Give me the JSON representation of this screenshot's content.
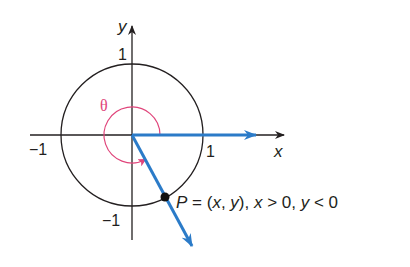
{
  "diagram": {
    "axes": {
      "x_label": "x",
      "y_label": "y",
      "x_ticks": [
        {
          "label": "−1",
          "value": -1
        },
        {
          "label": "1",
          "value": 1
        }
      ],
      "y_ticks": [
        {
          "label": "1",
          "value": 1
        },
        {
          "label": "−1",
          "value": -1
        }
      ]
    },
    "circle": {
      "type": "unit circle",
      "radius": 1
    },
    "angle": {
      "label": "θ",
      "color": "#e0457b",
      "direction": "counterclockwise",
      "approx_degrees": 300
    },
    "initial_side": {
      "color": "#2b7bc8",
      "along": "positive x-axis"
    },
    "terminal_side": {
      "color": "#2b7bc8",
      "quadrant": "IV"
    },
    "point": {
      "name": "P",
      "label_parts": {
        "p": "P",
        "eq": " = (",
        "x": "x",
        "comma": ", ",
        "y": "y",
        "close": "), ",
        "x2": "x",
        "gt": " > 0, ",
        "y2": "y",
        "lt": " < 0"
      }
    },
    "colors": {
      "axis": "#231f20",
      "circle": "#231f20",
      "ray": "#2b7bc8",
      "arc": "#e0457b"
    }
  }
}
